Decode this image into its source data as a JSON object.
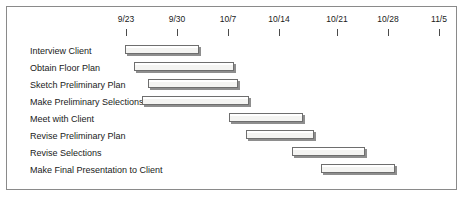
{
  "chart_data": {
    "type": "bar",
    "chart_subtype": "gantt",
    "title": "",
    "xlabel": "",
    "ylabel": "",
    "grid": false,
    "legend": "none",
    "axis": {
      "orientation": "horizontal-top",
      "tick_labels": [
        "9/23",
        "9/30",
        "10/7",
        "10/14",
        "10/21",
        "10/28",
        "11/5"
      ],
      "tick_x_px": [
        125,
        176,
        227,
        278,
        336,
        387,
        438
      ],
      "week_spacing_px": 51,
      "xlim_px": [
        6,
        457
      ]
    },
    "categories": [
      "Interview Client",
      "Obtain Floor Plan",
      "Sketch Preliminary Plan",
      "Make Preliminary Selections",
      "Meet with Client",
      "Revise Preliminary Plan",
      "Revise Selections",
      "Make Final Presentation to Client"
    ],
    "bars": [
      {
        "task": "Interview Client",
        "start_px": 124,
        "end_px": 198,
        "row_top_px": 0
      },
      {
        "task": "Obtain Floor Plan",
        "start_px": 133,
        "end_px": 233,
        "row_top_px": 17
      },
      {
        "task": "Sketch Preliminary Plan",
        "start_px": 147,
        "end_px": 237,
        "row_top_px": 34
      },
      {
        "task": "Make Preliminary Selections",
        "start_px": 141,
        "end_px": 248,
        "row_top_px": 51
      },
      {
        "task": "Meet with Client",
        "start_px": 228,
        "end_px": 302,
        "row_top_px": 68
      },
      {
        "task": "Revise Preliminary Plan",
        "start_px": 245,
        "end_px": 313,
        "row_top_px": 85
      },
      {
        "task": "Revise Selections",
        "start_px": 291,
        "end_px": 364,
        "row_top_px": 102
      },
      {
        "task": "Make Final Presentation to Client",
        "start_px": 320,
        "end_px": 394,
        "row_top_px": 119
      }
    ],
    "colors": {
      "bar_fill": "#f4f4f2",
      "bar_border": "#6e6e6e",
      "bar_shadow": "#8e8e8e",
      "frame_border": "#8a8a8a",
      "text": "#1a1a1a",
      "background": "#ffffff"
    }
  }
}
